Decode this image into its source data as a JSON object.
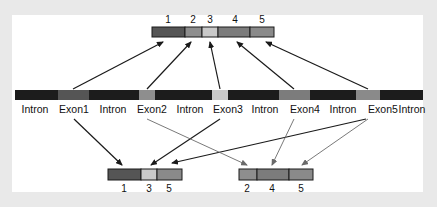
{
  "diagram": {
    "type": "alternative-splicing",
    "colors": {
      "background": "#e9e9e9",
      "panel": "#ffffff",
      "intron": "#1c1c1c",
      "exon1": "#555555",
      "exon2": "#8e8e8e",
      "exon3": "#c9c9c9",
      "exon4": "#7c7c7c",
      "exon5": "#8a8a8a",
      "arrow_dark": "#1a1a1a",
      "arrow_light": "#6a6a6a"
    },
    "gene": {
      "segments": [
        {
          "type": "intron",
          "label": "Intron"
        },
        {
          "type": "exon",
          "label": "Exon1"
        },
        {
          "type": "intron",
          "label": "Intron"
        },
        {
          "type": "exon",
          "label": "Exon2"
        },
        {
          "type": "intron",
          "label": "Intron"
        },
        {
          "type": "exon",
          "label": "Exon3"
        },
        {
          "type": "intron",
          "label": "Intron"
        },
        {
          "type": "exon",
          "label": "Exon4"
        },
        {
          "type": "intron",
          "label": "Intron"
        },
        {
          "type": "exon",
          "label": "Exon5"
        },
        {
          "type": "intron",
          "label": "Intron"
        }
      ]
    },
    "transcripts": [
      {
        "position": "top",
        "exons": [
          "1",
          "2",
          "3",
          "4",
          "5"
        ]
      },
      {
        "position": "bottom-left",
        "exons": [
          "1",
          "3",
          "5"
        ]
      },
      {
        "position": "bottom-right",
        "exons": [
          "2",
          "4",
          "5"
        ]
      }
    ]
  }
}
